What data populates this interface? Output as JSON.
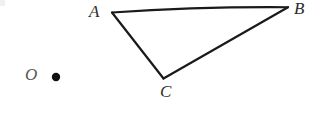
{
  "figure": {
    "background_color": "#ffffff",
    "stroke_color": "#1a1a1a",
    "label_color": "#2b2b2b",
    "width": 327,
    "height": 115
  },
  "labels": {
    "a": "A",
    "b": "B",
    "c": "C",
    "o": "O"
  },
  "geometry": {
    "points": {
      "A": {
        "x": 112,
        "y": 12
      },
      "B": {
        "x": 288,
        "y": 7
      },
      "C": {
        "x": 163,
        "y": 78
      },
      "O": {
        "x": 56,
        "y": 77
      }
    },
    "edges": [
      {
        "name": "AB",
        "from": "A",
        "to": "B"
      },
      {
        "name": "BC",
        "from": "B",
        "to": "C"
      },
      {
        "name": "CA",
        "from": "C",
        "to": "A"
      }
    ],
    "dot_radius": 4.2
  }
}
